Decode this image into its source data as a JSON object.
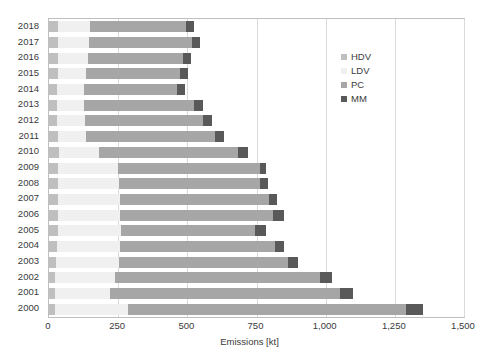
{
  "chart_data": {
    "type": "bar",
    "orientation": "horizontal",
    "stacked": true,
    "title": "",
    "xlabel": "Emissions [kt]",
    "ylabel": "",
    "xlim": [
      0,
      1500
    ],
    "xticks": [
      0,
      250,
      500,
      750,
      1000,
      1250,
      1500
    ],
    "xtick_labels": [
      "0",
      "250",
      "500",
      "750",
      "1,000",
      "1,250",
      "1,500"
    ],
    "grid": true,
    "grid_axis": "x",
    "legend_position": "upper right inside",
    "categories": [
      "2018",
      "2017",
      "2016",
      "2015",
      "2014",
      "2013",
      "2012",
      "2011",
      "2010",
      "2009",
      "2008",
      "2007",
      "2006",
      "2005",
      "2004",
      "2003",
      "2002",
      "2001",
      "2000"
    ],
    "series": [
      {
        "name": "HDV",
        "color": "#bfbfbf",
        "values": [
          33,
          33,
          33,
          31,
          30,
          30,
          30,
          31,
          35,
          33,
          33,
          33,
          33,
          31,
          28,
          24,
          22,
          22,
          22
        ]
      },
      {
        "name": "LDV",
        "color": "#f0f0f0",
        "values": [
          117,
          112,
          107,
          101,
          97,
          98,
          100,
          104,
          145,
          215,
          219,
          222,
          225,
          228,
          229,
          229,
          215,
          200,
          265
        ]
      },
      {
        "name": "PC",
        "color": "#a6a6a6",
        "values": [
          345,
          372,
          346,
          340,
          335,
          396,
          425,
          464,
          502,
          515,
          512,
          540,
          550,
          486,
          560,
          610,
          743,
          830,
          1003
        ]
      },
      {
        "name": "MM",
        "color": "#595959",
        "values": [
          28,
          30,
          28,
          32,
          29,
          33,
          35,
          35,
          38,
          23,
          26,
          28,
          43,
          38,
          33,
          37,
          44,
          48,
          63
        ]
      }
    ],
    "totals": [
      523,
      547,
      514,
      504,
      491,
      557,
      590,
      634,
      720,
      786,
      790,
      823,
      851,
      783,
      850,
      900,
      1024,
      1100,
      1353
    ]
  },
  "legend": {
    "items": [
      {
        "label": "HDV",
        "color": "#bfbfbf"
      },
      {
        "label": "LDV",
        "color": "#f0f0f0"
      },
      {
        "label": "PC",
        "color": "#a6a6a6"
      },
      {
        "label": "MM",
        "color": "#595959"
      }
    ]
  },
  "axis": {
    "x_title": "Emissions [kt]"
  }
}
